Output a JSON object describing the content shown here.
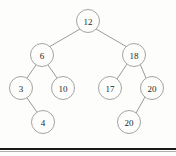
{
  "figure": {
    "kind": "binary-search-tree-diagram",
    "background_color": "#fdfdfc",
    "node_stroke_color": "#9a9a9a",
    "edge_stroke_color": "#8d8d8d",
    "label_color": "#1d1d1d",
    "node_radius": 11.5,
    "rule_color": "#1a1a1a"
  },
  "chart_data": {
    "type": "diagram",
    "title": "",
    "nodes": [
      {
        "id": "n12",
        "label": "12",
        "x": 88,
        "y": 21,
        "level": 0
      },
      {
        "id": "n6",
        "label": "6",
        "x": 42,
        "y": 55,
        "level": 1
      },
      {
        "id": "n18",
        "label": "18",
        "x": 134,
        "y": 55,
        "level": 1
      },
      {
        "id": "n3",
        "label": "3",
        "x": 21,
        "y": 88,
        "level": 2
      },
      {
        "id": "n10",
        "label": "10",
        "x": 63,
        "y": 88,
        "level": 2
      },
      {
        "id": "n17",
        "label": "17",
        "x": 110,
        "y": 88,
        "level": 2
      },
      {
        "id": "n20",
        "label": "20",
        "x": 152,
        "y": 88,
        "level": 2
      },
      {
        "id": "n4",
        "label": "4",
        "x": 43,
        "y": 122,
        "level": 3
      },
      {
        "id": "n20dup",
        "label": "20",
        "x": 129,
        "y": 122,
        "level": 3
      }
    ],
    "edges": [
      {
        "from": "n12",
        "to": "n6",
        "x1": 80,
        "y1": 29,
        "x2": 49,
        "y2": 47
      },
      {
        "from": "n12",
        "to": "n18",
        "x1": 96,
        "y1": 29,
        "x2": 127,
        "y2": 47
      },
      {
        "from": "n6",
        "to": "n3",
        "x1": 36,
        "y1": 65,
        "x2": 27,
        "y2": 78
      },
      {
        "from": "n6",
        "to": "n10",
        "x1": 48,
        "y1": 65,
        "x2": 57,
        "y2": 78
      },
      {
        "from": "n18",
        "to": "n17",
        "x1": 127,
        "y1": 64,
        "x2": 117,
        "y2": 79
      },
      {
        "from": "n18",
        "to": "n20",
        "x1": 140,
        "y1": 64,
        "x2": 146,
        "y2": 78
      },
      {
        "from": "n3",
        "to": "n4",
        "x1": 27,
        "y1": 98,
        "x2": 37,
        "y2": 112
      },
      {
        "from": "n20",
        "to": "n20dup",
        "x1": 145,
        "y1": 97,
        "x2": 136,
        "y2": 113
      }
    ]
  }
}
